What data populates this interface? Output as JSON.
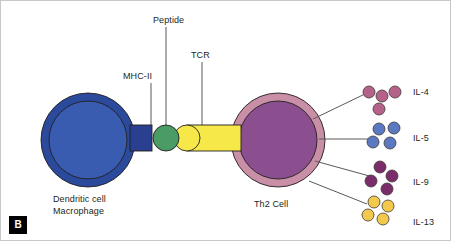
{
  "figure": {
    "panel_tag": "B",
    "background_color": "#ffffff",
    "border_color": "#c8c8c8",
    "width": 451,
    "height": 241
  },
  "labels": {
    "peptide": "Peptide",
    "tcr": "TCR",
    "mhc_ii": "MHC-II",
    "apc_line1": "Dendritic cell",
    "apc_line2": "Macrophage",
    "th2": "Th2 Cell"
  },
  "cells": [
    {
      "name": "dendritic-cell-macrophage",
      "label": "Dendritic cell Macrophage",
      "cx": 87,
      "cy": 139,
      "outer_r": 47,
      "inner_r": 39,
      "outer_color": "#2b4a9b",
      "inner_color": "#3a5cb0"
    },
    {
      "name": "th2-cell",
      "label": "Th2 Cell",
      "cx": 277,
      "cy": 139,
      "outer_r": 47,
      "inner_r": 39,
      "outer_color": "#c88fa6",
      "inner_color": "#8b4f8f"
    }
  ],
  "synapse": {
    "mhc_ii": {
      "name": "mhc-ii-molecule",
      "x": 129,
      "y": 124,
      "width": 22,
      "height": 26,
      "color": "#2b3f91"
    },
    "peptide": {
      "name": "peptide-molecule",
      "cx": 165,
      "cy": 137,
      "r": 13,
      "color": "#4a9b64"
    },
    "tcr_head": {
      "name": "tcr-head",
      "cx": 186,
      "cy": 137,
      "r": 13,
      "color": "#f7e84a"
    },
    "tcr_bar": {
      "name": "tcr-bar",
      "x": 186,
      "y": 124,
      "width": 54,
      "height": 26,
      "color": "#f7e84a"
    }
  },
  "cytokines": [
    {
      "name": "il-4",
      "label": "IL-4",
      "color": "#b5628a",
      "label_x": 412,
      "label_y": 86,
      "leader": {
        "x1": 312,
        "y1": 118,
        "x2": 366,
        "y2": 92
      },
      "dots": [
        {
          "cx": 368,
          "cy": 91,
          "r": 6
        },
        {
          "cx": 381,
          "cy": 95,
          "r": 6
        },
        {
          "cx": 394,
          "cy": 91,
          "r": 6
        },
        {
          "cx": 378,
          "cy": 108,
          "r": 6
        }
      ]
    },
    {
      "name": "il-5",
      "label": "IL-5",
      "color": "#5b79c0",
      "label_x": 412,
      "label_y": 132,
      "leader": {
        "x1": 318,
        "y1": 138,
        "x2": 368,
        "y2": 138
      },
      "dots": [
        {
          "cx": 378,
          "cy": 128,
          "r": 6
        },
        {
          "cx": 393,
          "cy": 127,
          "r": 6
        },
        {
          "cx": 372,
          "cy": 141,
          "r": 6
        },
        {
          "cx": 389,
          "cy": 142,
          "r": 6
        }
      ]
    },
    {
      "name": "il-9",
      "label": "IL-9",
      "color": "#7b2d6b",
      "label_x": 412,
      "label_y": 176,
      "leader": {
        "x1": 314,
        "y1": 160,
        "x2": 372,
        "y2": 176
      },
      "dots": [
        {
          "cx": 379,
          "cy": 166,
          "r": 6
        },
        {
          "cx": 391,
          "cy": 175,
          "r": 6
        },
        {
          "cx": 370,
          "cy": 180,
          "r": 6
        },
        {
          "cx": 386,
          "cy": 188,
          "r": 6
        }
      ]
    },
    {
      "name": "il-13",
      "label": "IL-13",
      "color": "#f2c94c",
      "label_x": 412,
      "label_y": 216,
      "leader": {
        "x1": 308,
        "y1": 180,
        "x2": 366,
        "y2": 203
      },
      "dots": [
        {
          "cx": 373,
          "cy": 201,
          "r": 6
        },
        {
          "cx": 387,
          "cy": 205,
          "r": 6
        },
        {
          "cx": 367,
          "cy": 214,
          "r": 6
        },
        {
          "cx": 382,
          "cy": 218,
          "r": 6
        }
      ]
    }
  ],
  "leader_lines": [
    {
      "name": "peptide-leader",
      "x1": 165,
      "y1": 26,
      "x2": 165,
      "y2": 124
    },
    {
      "name": "tcr-leader",
      "x1": 201,
      "y1": 61,
      "x2": 201,
      "y2": 124
    },
    {
      "name": "mhc-ii-leader",
      "x1": 150,
      "y1": 82,
      "x2": 150,
      "y2": 124
    }
  ]
}
